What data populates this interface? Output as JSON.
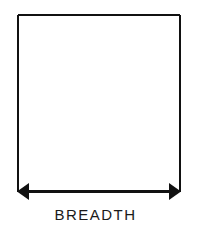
{
  "diagram": {
    "label": "BREADTH",
    "stroke_color": "#111111",
    "background": "#ffffff"
  }
}
